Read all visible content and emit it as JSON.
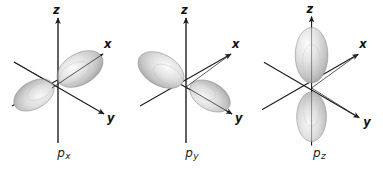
{
  "figure": {
    "title": "",
    "background_color": "#ffffff",
    "width": 383,
    "height": 170,
    "axis_color": "#1a1a1a",
    "lobe_fill_light": "#f2f2f2",
    "lobe_fill_mid": "#d6d6d6",
    "lobe_fill_dark": "#9a9a9a",
    "lobe_stroke": "#8c8c8c"
  },
  "panels": [
    {
      "id": "px",
      "caption_base": "p",
      "caption_sub": "x",
      "orientation": "x-axis",
      "axes": [
        {
          "name": "z",
          "label": "z"
        },
        {
          "name": "x",
          "label": "x"
        },
        {
          "name": "y",
          "label": "y"
        }
      ]
    },
    {
      "id": "py",
      "caption_base": "p",
      "caption_sub": "y",
      "orientation": "y-axis",
      "axes": [
        {
          "name": "z",
          "label": "z"
        },
        {
          "name": "x",
          "label": "x"
        },
        {
          "name": "y",
          "label": "y"
        }
      ]
    },
    {
      "id": "pz",
      "caption_base": "p",
      "caption_sub": "z",
      "orientation": "z-axis",
      "axes": [
        {
          "name": "z",
          "label": "z"
        },
        {
          "name": "x",
          "label": "x"
        },
        {
          "name": "y",
          "label": "y"
        }
      ]
    }
  ]
}
